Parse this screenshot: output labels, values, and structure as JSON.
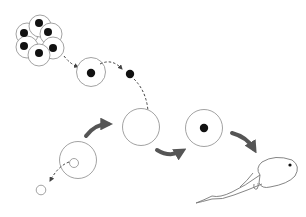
{
  "diagram": {
    "type": "process-flow",
    "text_labels": [],
    "colors": {
      "outline": "#8a8a8a",
      "nucleus": "#111111",
      "arrow": "#555555",
      "dashed_arrow": "#444444",
      "background": "#ffffff"
    },
    "nodes": [
      {
        "id": "embryo-cluster",
        "description": "cluster of six cells, each with a dark nucleus"
      },
      {
        "id": "isolated-cell",
        "description": "single cell with dark nucleus"
      },
      {
        "id": "extracted-nucleus",
        "description": "free dark nucleus"
      },
      {
        "id": "donor-egg",
        "description": "large cell with small pale nucleus"
      },
      {
        "id": "removed-nucleus",
        "description": "small pale circle (nucleus removed)"
      },
      {
        "id": "enucleated-egg",
        "description": "large empty cell receiving nucleus"
      },
      {
        "id": "reconstructed-egg",
        "description": "large cell with dark transplanted nucleus"
      },
      {
        "id": "tadpole",
        "description": "resulting tadpole"
      }
    ],
    "edges": [
      {
        "from": "embryo-cluster",
        "to": "isolated-cell",
        "style": "dashed"
      },
      {
        "from": "isolated-cell",
        "to": "extracted-nucleus",
        "style": "dashed"
      },
      {
        "from": "extracted-nucleus",
        "to": "enucleated-egg",
        "style": "dashed"
      },
      {
        "from": "donor-egg",
        "to": "removed-nucleus",
        "style": "dashed"
      },
      {
        "from": "donor-egg",
        "to": "enucleated-egg",
        "style": "solid-thick"
      },
      {
        "from": "enucleated-egg",
        "to": "reconstructed-egg",
        "style": "solid-thick"
      },
      {
        "from": "reconstructed-egg",
        "to": "tadpole",
        "style": "solid-thick"
      }
    ]
  }
}
